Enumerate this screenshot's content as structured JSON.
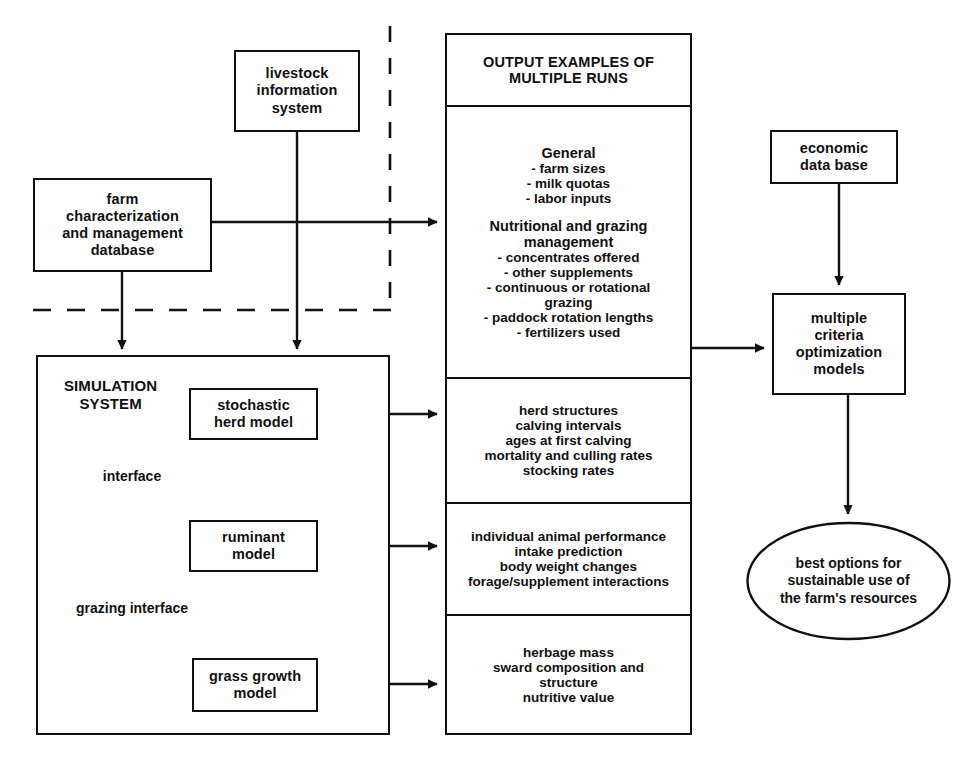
{
  "diagram": {
    "stroke_color": "#111111",
    "background_color": "#ffffff"
  },
  "nodes": {
    "livestock": {
      "lines": [
        "livestock",
        "information",
        "system"
      ]
    },
    "farm": {
      "lines": [
        "farm",
        "characterization",
        "and management",
        "database"
      ]
    },
    "economic": {
      "lines": [
        "economic",
        "data base"
      ]
    },
    "simulation": {
      "title_lines": [
        "SIMULATION",
        "SYSTEM"
      ]
    },
    "stochastic_herd": {
      "lines": [
        "stochastic",
        "herd model"
      ]
    },
    "ruminant": {
      "lines": [
        "ruminant",
        "model"
      ]
    },
    "grass_growth": {
      "lines": [
        "grass growth",
        "model"
      ]
    },
    "multiple_criteria": {
      "lines": [
        "multiple",
        "criteria",
        "optimization",
        "models"
      ]
    },
    "goal": {
      "lines": [
        "best options for",
        "sustainable use of",
        "the farm's resources"
      ]
    }
  },
  "edge_labels": {
    "interface": [
      "interface"
    ],
    "grazing_interface": [
      "grazing",
      "interface"
    ]
  },
  "output_panel": {
    "header": [
      "OUTPUT EXAMPLES OF",
      "MULTIPLE RUNS"
    ],
    "section_general": {
      "title": "General",
      "bullets": [
        "- farm sizes",
        "- milk quotas",
        "- labor inputs"
      ]
    },
    "section_nutritional": {
      "title_lines": [
        "Nutritional and grazing",
        "management"
      ],
      "bullets": [
        "- concentrates offered",
        "- other supplements",
        "- continuous or rotational",
        "grazing",
        "- paddock rotation lengths",
        "- fertilizers used"
      ]
    },
    "section_herd": [
      "herd structures",
      "calving intervals",
      "ages at first calving",
      "mortality and culling rates",
      "stocking rates"
    ],
    "section_animal": [
      "individual animal performance",
      "intake prediction",
      "body weight changes",
      "forage/supplement interactions"
    ],
    "section_herbage": [
      "herbage mass",
      "sward composition and",
      "structure",
      "nutritive value"
    ]
  }
}
